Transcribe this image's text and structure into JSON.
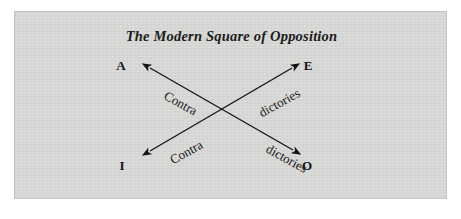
{
  "figure": {
    "title": "The Modern Square of Opposition",
    "background_color": "#ffffff",
    "panel_color": "#d6d6d4",
    "panel_border_color": "#c2c2c0",
    "ink_color": "#141414"
  },
  "vertices": [
    {
      "id": "A",
      "label": "A",
      "position": "top-left"
    },
    {
      "id": "E",
      "label": "E",
      "position": "top-right"
    },
    {
      "id": "I",
      "label": "I",
      "position": "bottom-left"
    },
    {
      "id": "O",
      "label": "O",
      "position": "bottom-right"
    }
  ],
  "relations": [
    {
      "id": "contradictories-a-o",
      "from": "A",
      "to": "O",
      "arrow": "double-headed",
      "word_first": "Contra",
      "word_second": "dictories"
    },
    {
      "id": "contradictories-i-e",
      "from": "I",
      "to": "E",
      "arrow": "double-headed",
      "word_first": "Contra",
      "word_second": "dictories"
    }
  ],
  "arrow_labels": {
    "upper_left_contra": "Contra",
    "upper_right_dictories": "dictories",
    "lower_left_contra": "Contra",
    "lower_right_dictories": "dictories"
  }
}
